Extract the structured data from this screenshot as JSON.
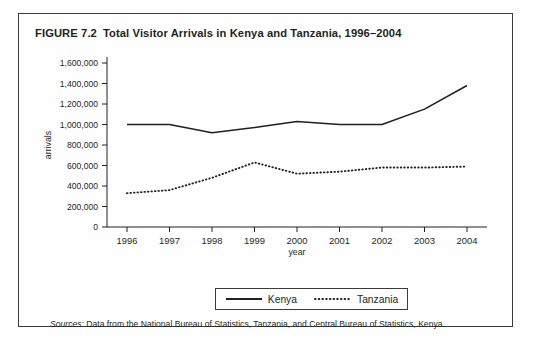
{
  "figure": {
    "number": "FIGURE 7.2",
    "title": "Total Visitor Arrivals in Kenya and Tanzania, 1996–2004",
    "border_color": "#3b3b3b"
  },
  "source_note": {
    "lead": "Sources:",
    "text": " Data from the National Bureau of Statistics, Tanzania, and Central Bureau of Statistics, Kenya."
  },
  "legend": {
    "entries": [
      {
        "label": "Kenya",
        "style": "solid",
        "color": "#231f20"
      },
      {
        "label": "Tanzania",
        "style": "dotted",
        "color": "#231f20"
      }
    ]
  },
  "chart_data": {
    "type": "line",
    "title": "Total Visitor Arrivals in Kenya and Tanzania, 1996–2004",
    "xlabel": "year",
    "ylabel": "arrivals",
    "x": [
      "1996",
      "1997",
      "1998",
      "1999",
      "2000",
      "2001",
      "2002",
      "2003",
      "2004"
    ],
    "categories": [
      "1996",
      "1997",
      "1998",
      "1999",
      "2000",
      "2001",
      "2002",
      "2003",
      "2004"
    ],
    "ylim": [
      0,
      1600000
    ],
    "ytick_step": 200000,
    "ytick_labels": [
      "0",
      "200,000",
      "400,000",
      "600,000",
      "800,000",
      "1,000,000",
      "1,200,000",
      "1,400,000",
      "1,600,000"
    ],
    "grid": false,
    "legend_position": "bottom",
    "series": [
      {
        "name": "Kenya",
        "style": "solid",
        "color": "#231f20",
        "values": [
          1000000,
          1000000,
          920000,
          970000,
          1030000,
          1000000,
          1000000,
          1150000,
          1380000
        ]
      },
      {
        "name": "Tanzania",
        "style": "dotted",
        "color": "#231f20",
        "values": [
          330000,
          360000,
          480000,
          630000,
          520000,
          540000,
          580000,
          580000,
          590000
        ]
      }
    ]
  }
}
